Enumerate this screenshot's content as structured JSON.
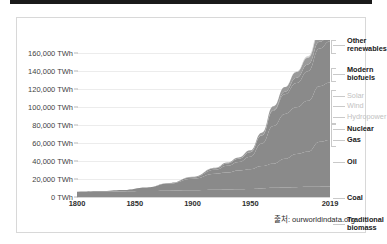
{
  "top_bar": {
    "present": true,
    "color": "#1a1a1a"
  },
  "source": {
    "text": "출처: ourworldindata.org"
  },
  "colors": {
    "area_fill": "#8a8a8a",
    "area_fill_light": "#bdbdbd",
    "area_fill_lighter": "#d2d2d2",
    "gridline": "#ececec",
    "legend_dark": "#202020",
    "legend_light": "#c2c2c2",
    "card_border": "#d8d8d8"
  },
  "chart_data": {
    "type": "area",
    "title": "",
    "subtitle": "",
    "xlabel": "",
    "ylabel": "",
    "grid": true,
    "legend_position": "right",
    "xlim": [
      1800,
      2019
    ],
    "ylim": [
      0,
      175000
    ],
    "yticks": [
      0,
      20000,
      40000,
      60000,
      80000,
      100000,
      120000,
      140000,
      160000
    ],
    "ytick_labels": [
      "0 TWh",
      "20,000 TWh",
      "40,000 TWh",
      "60,000 TWh",
      "80,000 TWh",
      "100,000 TWh",
      "120,000 TWh",
      "140,000 TWh",
      "160,000 TWh"
    ],
    "xticks": [
      1800,
      1850,
      1900,
      1950,
      2019
    ],
    "xtick_labels": [
      "1800",
      "1850",
      "1900",
      "1950",
      "2019"
    ],
    "x": [
      1800,
      1820,
      1840,
      1860,
      1880,
      1900,
      1920,
      1930,
      1940,
      1950,
      1960,
      1970,
      1980,
      1990,
      2000,
      2010,
      2019
    ],
    "series": [
      {
        "name": "Traditional biomass",
        "label_style": "dark",
        "values": [
          5600,
          5900,
          6200,
          6600,
          7000,
          7400,
          8000,
          8300,
          8600,
          9000,
          9600,
          10200,
          10600,
          11000,
          11300,
          11500,
          11600
        ]
      },
      {
        "name": "Coal",
        "label_style": "dark",
        "values": [
          300,
          700,
          1600,
          4000,
          8000,
          13000,
          18000,
          19000,
          21000,
          22000,
          25000,
          27000,
          32000,
          37000,
          39000,
          50000,
          52000
        ]
      },
      {
        "name": "Oil",
        "label_style": "dark",
        "values": [
          0,
          0,
          0,
          100,
          400,
          1500,
          4500,
          7500,
          9500,
          14000,
          25000,
          42000,
          50000,
          52000,
          57000,
          62000,
          64000
        ]
      },
      {
        "name": "Gas",
        "label_style": "dark",
        "values": [
          0,
          0,
          0,
          0,
          100,
          500,
          1500,
          2500,
          3500,
          5000,
          9000,
          17000,
          22000,
          27000,
          33000,
          42000,
          46000
        ]
      },
      {
        "name": "Nuclear",
        "label_style": "dark",
        "values": [
          0,
          0,
          0,
          0,
          0,
          0,
          0,
          0,
          0,
          0,
          100,
          700,
          2800,
          6000,
          7500,
          7500,
          7100
        ]
      },
      {
        "name": "Hydropower",
        "label_style": "light",
        "values": [
          0,
          0,
          0,
          0,
          0,
          200,
          700,
          1100,
          1500,
          2000,
          3000,
          4200,
          5100,
          6300,
          7500,
          9500,
          11000
        ]
      },
      {
        "name": "Wind",
        "label_style": "light",
        "values": [
          0,
          0,
          0,
          0,
          0,
          0,
          0,
          0,
          0,
          0,
          0,
          0,
          0,
          100,
          300,
          1000,
          3700
        ]
      },
      {
        "name": "Solar",
        "label_style": "light",
        "values": [
          0,
          0,
          0,
          0,
          0,
          0,
          0,
          0,
          0,
          0,
          0,
          0,
          0,
          0,
          50,
          300,
          2300
        ]
      },
      {
        "name": "Modern biofuels",
        "label_style": "dark",
        "values": [
          0,
          0,
          0,
          0,
          0,
          0,
          0,
          0,
          0,
          0,
          0,
          0,
          100,
          300,
          700,
          1600,
          2400
        ]
      },
      {
        "name": "Other renewables",
        "label_style": "dark",
        "values": [
          0,
          0,
          0,
          0,
          0,
          0,
          0,
          0,
          0,
          0,
          0,
          0,
          100,
          300,
          700,
          1800,
          3200
        ]
      }
    ],
    "legend_entries": [
      {
        "label": "Other\nrenewables",
        "style": "dark",
        "y": 27
      },
      {
        "label": "Modern\nbiofuels",
        "style": "dark",
        "y": 56
      },
      {
        "label": "Solar",
        "style": "light",
        "y": 78
      },
      {
        "label": "Wind",
        "style": "light",
        "y": 88
      },
      {
        "label": "Hydropower",
        "style": "light",
        "y": 99
      },
      {
        "label": "Nuclear",
        "style": "dark",
        "y": 111
      },
      {
        "label": "Gas",
        "style": "dark",
        "y": 122
      },
      {
        "label": "Oil",
        "style": "dark",
        "y": 144
      },
      {
        "label": "Coal",
        "style": "dark",
        "y": 180
      },
      {
        "label": "Traditional\nbiomass",
        "style": "dark",
        "y": 206
      }
    ]
  }
}
